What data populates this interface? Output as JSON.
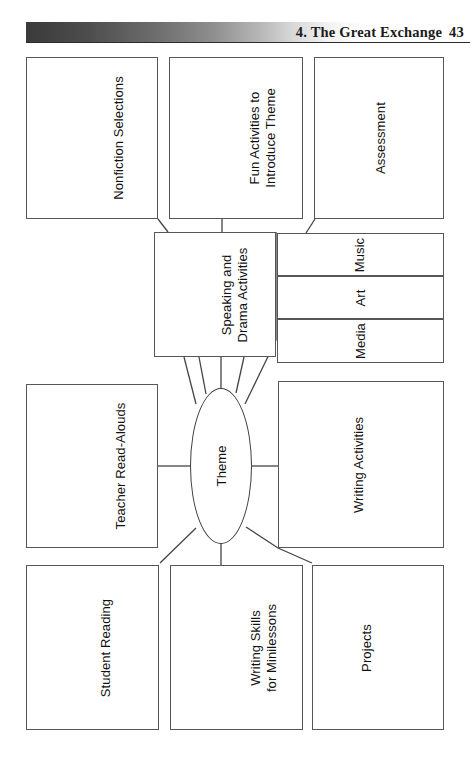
{
  "page": {
    "header": {
      "chapter_title": "4. The Great Exchange",
      "page_number": "43"
    }
  },
  "diagram": {
    "type": "web-cluster-map",
    "center": {
      "label": "Theme",
      "shape": "ellipse"
    },
    "nodes": [
      {
        "id": "nonfiction-selections",
        "label": "Nonfiction Selections",
        "lines": [
          "Nonfiction Selections"
        ]
      },
      {
        "id": "fun-activities",
        "label": "Fun Activities to Introduce Theme",
        "lines": [
          "Fun Activities to",
          "Introduce Theme"
        ]
      },
      {
        "id": "assessment",
        "label": "Assessment",
        "lines": [
          "Assessment"
        ]
      },
      {
        "id": "speaking-drama",
        "label": "Speaking and Drama Activities",
        "lines": [
          "Speaking and",
          "Drama Activities"
        ]
      },
      {
        "id": "music",
        "label": "Music",
        "lines": [
          "Music"
        ]
      },
      {
        "id": "art",
        "label": "Art",
        "lines": [
          "Art"
        ]
      },
      {
        "id": "media",
        "label": "Media",
        "lines": [
          "Media"
        ]
      },
      {
        "id": "teacher-read-alouds",
        "label": "Teacher Read-Alouds",
        "lines": [
          "Teacher Read-Alouds"
        ]
      },
      {
        "id": "writing-activities",
        "label": "Writing Activities",
        "lines": [
          "Writing Activities"
        ]
      },
      {
        "id": "student-reading",
        "label": "Student Reading",
        "lines": [
          "Student Reading"
        ]
      },
      {
        "id": "writing-skills",
        "label": "Writing Skills for Minilessons",
        "lines": [
          "Writing Skills",
          "for Minilessons"
        ]
      },
      {
        "id": "projects",
        "label": "Projects",
        "lines": [
          "Projects"
        ]
      }
    ],
    "colors": {
      "box_stroke": "#565656",
      "line_stroke": "#444444",
      "text": "#111111",
      "header_bar_dark": "#3a3a3a",
      "background": "#ffffff"
    }
  }
}
